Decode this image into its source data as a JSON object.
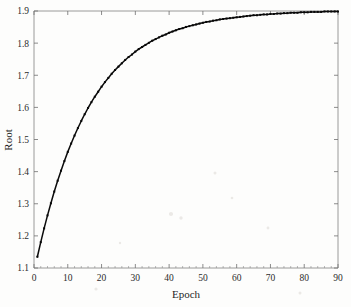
{
  "figure": {
    "background_color": "#fdfdfc",
    "frame_color": "#8e8e8e",
    "series_color": "#0b0b0b"
  },
  "chart_data": {
    "type": "line",
    "title": "",
    "xlabel": "Epoch",
    "ylabel": "Root",
    "xlim": [
      0,
      90
    ],
    "ylim": [
      1.1,
      1.9
    ],
    "xticks": [
      0,
      10,
      20,
      30,
      40,
      50,
      60,
      70,
      80,
      90
    ],
    "xtick_labels": [
      "0",
      "10",
      "20",
      "30",
      "40",
      "50",
      "60",
      "70",
      "80",
      "90"
    ],
    "yticks": [
      1.1,
      1.2,
      1.3,
      1.4,
      1.5,
      1.6,
      1.7,
      1.8,
      1.9
    ],
    "ytick_labels": [
      "1.1",
      "1.2",
      "1.3",
      "1.4",
      "1.5",
      "1.6",
      "1.7",
      "1.8",
      "1.9"
    ],
    "grid": false,
    "legend": null,
    "marker": "square",
    "series": [
      {
        "name": "Root",
        "x": [
          1,
          2,
          3,
          4,
          5,
          6,
          7,
          8,
          9,
          10,
          11,
          12,
          13,
          14,
          15,
          16,
          17,
          18,
          19,
          20,
          21,
          22,
          23,
          24,
          25,
          26,
          27,
          28,
          29,
          30,
          31,
          32,
          33,
          34,
          35,
          36,
          37,
          38,
          39,
          40,
          41,
          42,
          43,
          44,
          45,
          46,
          47,
          48,
          49,
          50,
          51,
          52,
          53,
          54,
          55,
          56,
          57,
          58,
          59,
          60,
          61,
          62,
          63,
          64,
          65,
          66,
          67,
          68,
          69,
          70,
          71,
          72,
          73,
          74,
          75,
          76,
          77,
          78,
          79,
          80,
          81,
          82,
          83,
          84,
          85,
          86,
          87,
          88,
          89,
          90
        ],
        "values": [
          1.135,
          1.17,
          1.203,
          1.234,
          1.263,
          1.291,
          1.317,
          1.341,
          1.364,
          1.386,
          1.406,
          1.425,
          1.443,
          1.46,
          1.476,
          1.491,
          1.505,
          1.518,
          1.53,
          1.542,
          1.553,
          1.563,
          1.573,
          1.582,
          1.59,
          1.598,
          1.606,
          1.613,
          1.619,
          1.626,
          1.632,
          1.637,
          1.642,
          1.647,
          1.652,
          1.656,
          1.66,
          1.664,
          1.667,
          1.671,
          1.674,
          1.677,
          1.68,
          1.682,
          1.685,
          1.687,
          1.689,
          1.691,
          1.693,
          1.695,
          1.697,
          1.698,
          1.7,
          1.701,
          1.703,
          1.704,
          1.705,
          1.706,
          1.707,
          1.708,
          1.709,
          1.71,
          1.711,
          1.712,
          1.713,
          1.713,
          1.714,
          1.715,
          1.715,
          1.716,
          1.716,
          1.717,
          1.717,
          1.718,
          1.718,
          1.719,
          1.719,
          1.719,
          1.72,
          1.72,
          1.72,
          1.721,
          1.721,
          1.721,
          1.721,
          1.722,
          1.722,
          1.722,
          1.722,
          1.722
        ]
      }
    ]
  }
}
